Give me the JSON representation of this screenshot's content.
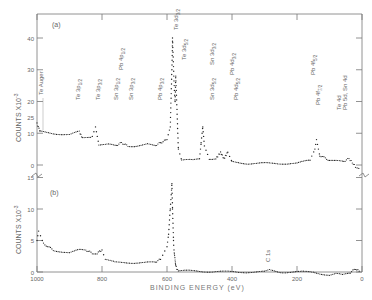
{
  "chart_data": [
    {
      "panel": "(a)",
      "type": "scatter",
      "title": "",
      "xlabel": "BINDING ENERGY (eV)",
      "ylabel": "COUNTS X10^-3",
      "xlim": [
        1000,
        0
      ],
      "ylim": [
        0,
        45
      ],
      "yticks": [
        0,
        10,
        20,
        30,
        40
      ],
      "xticks": [
        1000,
        800,
        600,
        400,
        200,
        0
      ],
      "annotations": [
        {
          "label": "Te Auger",
          "x": 985
        },
        {
          "label": "Te 3p1/2",
          "x": 870
        },
        {
          "label": "Te 3p3/2",
          "x": 820
        },
        {
          "label": "Pb 4p1/2",
          "x": 645
        },
        {
          "label": "Sn 3p1/2",
          "x": 715
        },
        {
          "label": "Sn 3p3/2",
          "x": 757
        },
        {
          "label": "Pb 4p3/2",
          "x": 643
        },
        {
          "label": "Te 3d3/2",
          "x": 583
        },
        {
          "label": "Te 3d5/2",
          "x": 573
        },
        {
          "label": "Sn 3d3/2",
          "x": 495
        },
        {
          "label": "Sn 3d5/2",
          "x": 485
        },
        {
          "label": "Pb 4d3/2",
          "x": 435
        },
        {
          "label": "Pb 4d5/2",
          "x": 413
        },
        {
          "label": "Pb 4f5/2",
          "x": 143
        },
        {
          "label": "Pb 4f7/2",
          "x": 138
        },
        {
          "label": "Te 4d",
          "x": 40
        },
        {
          "label": "Pb 5d, Sn 4d",
          "x": 20
        }
      ],
      "series": [
        {
          "name": "spectrum (a)",
          "x": [
            1000,
            990,
            950,
            900,
            870,
            860,
            830,
            820,
            810,
            780,
            760,
            740,
            720,
            700,
            660,
            640,
            620,
            600,
            590,
            585,
            583,
            578,
            575,
            573,
            565,
            555,
            540,
            520,
            500,
            495,
            490,
            485,
            470,
            450,
            435,
            425,
            413,
            400,
            350,
            300,
            250,
            200,
            160,
            145,
            140,
            130,
            100,
            60,
            40,
            20,
            5
          ],
          "y": [
            13,
            10.5,
            10,
            9.5,
            10.5,
            8.5,
            9,
            12,
            6.5,
            6.5,
            6,
            7,
            6,
            6,
            6.5,
            6,
            7,
            8,
            12,
            30,
            40,
            25,
            20,
            28,
            5,
            1.5,
            1.5,
            1.5,
            2,
            7,
            12,
            6,
            2,
            2,
            4,
            2,
            4,
            1,
            0.5,
            0.5,
            0.5,
            0.5,
            1.5,
            5,
            8,
            3,
            1.5,
            1,
            2,
            -0.5,
            -1
          ]
        }
      ]
    },
    {
      "panel": "(b)",
      "type": "scatter",
      "title": "",
      "xlabel": "BINDING ENERGY (eV)",
      "ylabel": "COUNTS X10^-3",
      "xlim": [
        1000,
        0
      ],
      "ylim": [
        0,
        25
      ],
      "yticks": [
        0,
        5,
        10,
        15
      ],
      "xticks": [
        1000,
        800,
        600,
        400,
        200,
        0
      ],
      "annotations": [
        {
          "label": "C 1s",
          "x": 285
        }
      ],
      "series": [
        {
          "name": "spectrum (b)",
          "x": [
            1000,
            995,
            980,
            950,
            900,
            870,
            850,
            830,
            815,
            800,
            790,
            760,
            720,
            680,
            640,
            620,
            600,
            595,
            590,
            585,
            583,
            580,
            578,
            575,
            573,
            570,
            565,
            550,
            500,
            450,
            400,
            350,
            300,
            285,
            250,
            200,
            150,
            120,
            100,
            80,
            60,
            40,
            20,
            5
          ],
          "y": [
            5,
            6.5,
            4.5,
            3.5,
            3,
            3.5,
            3.5,
            3,
            3,
            3.5,
            2,
            1.5,
            1.5,
            1.5,
            1.5,
            2,
            4,
            6,
            10,
            14,
            10,
            5,
            3,
            2,
            1,
            0.5,
            0.2,
            0.2,
            0.1,
            0.1,
            0,
            0,
            0,
            0.3,
            0,
            0,
            0,
            -0.3,
            -0.5,
            -0.3,
            -0.5,
            -0.2,
            0.5,
            0
          ]
        }
      ]
    }
  ],
  "labels": {
    "panel_a": "(a)",
    "panel_b": "(b)",
    "ylabel": "COUNTS X10",
    "ylabel_exp": "-3",
    "xlabel": "BINDING ENERGY (eV)",
    "c1s": "C 1s"
  }
}
